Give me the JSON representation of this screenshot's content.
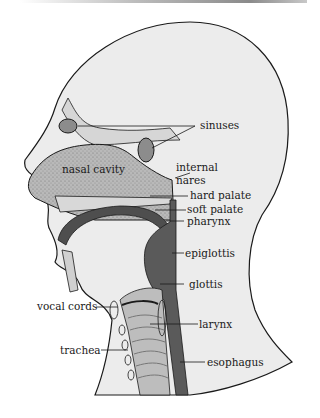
{
  "figure": {
    "type": "anatomical-diagram",
    "colors": {
      "skin": "#e9e9e9",
      "cavity": "#b8b8b8",
      "dark_tract": "#5a5a5a",
      "outline": "#1a1a1a",
      "background": "#ffffff"
    }
  },
  "labels": {
    "sinuses": "sinuses",
    "nasal_cavity": "nasal cavity",
    "internal_nares_1": "internal",
    "internal_nares_2": "nares",
    "hard_palate": "hard palate",
    "soft_palate": "soft palate",
    "pharynx": "pharynx",
    "epiglottis": "epiglottis",
    "glottis": "glottis",
    "vocal_cords": "vocal cords",
    "larynx": "larynx",
    "trachea": "trachea",
    "esophagus": "esophagus"
  }
}
